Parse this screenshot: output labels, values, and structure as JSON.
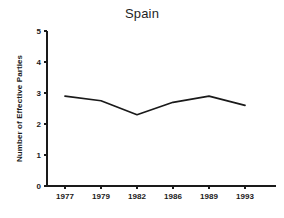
{
  "chart_data": {
    "type": "line",
    "title": "Spain",
    "xlabel": "",
    "ylabel": "Number of Effective Parties",
    "categories": [
      "1977",
      "1979",
      "1982",
      "1986",
      "1989",
      "1993"
    ],
    "values": [
      2.9,
      2.75,
      2.3,
      2.7,
      2.9,
      2.6
    ],
    "series": [
      {
        "name": "Number of Effective Parties",
        "values": [
          2.9,
          2.75,
          2.3,
          2.7,
          2.9,
          2.6
        ]
      }
    ],
    "ylim": [
      0,
      5
    ],
    "ytick_labels": [
      "0",
      "1",
      "2",
      "3",
      "4",
      "5"
    ],
    "ytick_values": [
      0,
      1,
      2,
      3,
      4,
      5
    ],
    "grid": false,
    "legend": false,
    "line_color": "#1a1a1a",
    "background_color": "#ffffff"
  }
}
